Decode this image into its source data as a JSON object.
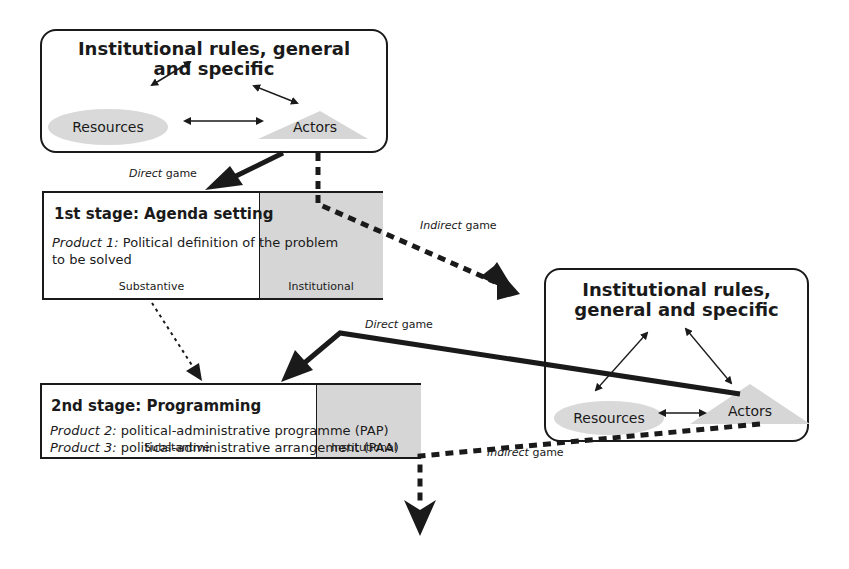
{
  "top_rules": {
    "title_line1": "Institutional rules, general",
    "title_line2": "and specific",
    "resources": "Resources",
    "actors": "Actors"
  },
  "right_rules": {
    "title_line1": "Institutional rules,",
    "title_line2": "general and specific",
    "resources": "Resources",
    "actors": "Actors"
  },
  "stage1": {
    "title": "1st stage: Agenda setting",
    "product_label": "Product 1:",
    "product_text_line1": " Political definition of the problem",
    "product_text_line2": "to be solved",
    "substantive": "Substantive",
    "institutional": "Institutional"
  },
  "stage2": {
    "title": "2nd stage: Programming",
    "product2_label": "Product 2:",
    "product2_text": " political-administrative programme (PAP)",
    "product3_label": "Product 3:",
    "product3_text": " political-administrative arrangement (PAA)",
    "substantive": "Substantive",
    "institutional": "Institutional"
  },
  "games": {
    "direct_1_em": "Direct",
    "direct_1_rest": " game",
    "indirect_1_em": "Indirect",
    "indirect_1_rest": " game",
    "direct_2_em": "Direct",
    "direct_2_rest": " game",
    "indirect_2_em": "Indirect",
    "indirect_2_rest": " game"
  },
  "colors": {
    "line": "#1a1a1a",
    "shade": "#d6d6d6"
  }
}
